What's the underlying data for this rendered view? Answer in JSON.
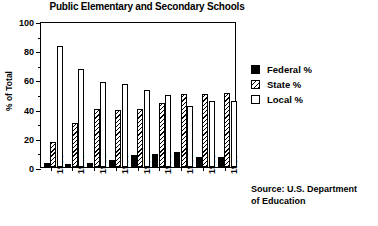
{
  "chart_data": {
    "type": "bar",
    "title": "Public Elementary and Secondary Schools",
    "xlabel": "",
    "ylabel": "% of Total",
    "categories": [
      "1930",
      "1940",
      "1950",
      "1960",
      "1970",
      "1975",
      "1980",
      "1985",
      "1987"
    ],
    "series": [
      {
        "name": "Federal %",
        "fill": "solid-black",
        "values": [
          3,
          2,
          3,
          5,
          8,
          9,
          10.5,
          7,
          7
        ]
      },
      {
        "name": "State %",
        "fill": "diagonal-hatch",
        "values": [
          17,
          30,
          40,
          39,
          40,
          44,
          50,
          50,
          51
        ]
      },
      {
        "name": "Local %",
        "fill": "white",
        "values": [
          83,
          67,
          58,
          57,
          53,
          49,
          42,
          45.5,
          45
        ]
      }
    ],
    "ylim": [
      0,
      100
    ],
    "yticks": [
      0,
      20,
      40,
      60,
      80,
      100
    ],
    "ytick_labels": [
      "0",
      "20",
      "40",
      "60",
      "80",
      "100"
    ],
    "yminor_ticks": [
      10,
      30,
      50,
      70,
      90
    ],
    "grid": false,
    "legend_position": "right",
    "annotations": [
      "Source: U.S. Department of Education"
    ]
  },
  "legend": {
    "entries": [
      {
        "label": "Federal %"
      },
      {
        "label": "State %"
      },
      {
        "label": "Local %"
      }
    ]
  },
  "source": {
    "line1": "Source: U.S. Department",
    "line2": "of Education"
  },
  "colors": {
    "axis": "#000000",
    "federal": "#000000",
    "state": "#000000",
    "local": "#ffffff",
    "background": "#ffffff"
  }
}
